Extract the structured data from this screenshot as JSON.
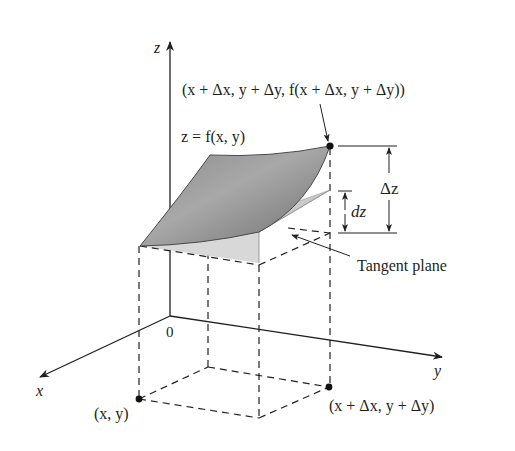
{
  "figure": {
    "axes": {
      "x_label": "x",
      "y_label": "y",
      "z_label": "z",
      "origin_label": "0"
    },
    "labels": {
      "surface": "z = f(x, y)",
      "top_point": "(x + Δx, y + Δy, f(x + Δx, y + Δy))",
      "delta_z": "Δz",
      "dz": "dz",
      "tangent_plane": "Tangent plane",
      "base_point": "(x, y)",
      "shifted_point": "(x + Δx, y + Δy)"
    },
    "colors": {
      "surface_fill": "#7d7d7d",
      "surface_edge": "#4a4a4a",
      "plane_fill": "#cfcfcf",
      "line": "#231f20",
      "background": "#ffffff"
    }
  }
}
